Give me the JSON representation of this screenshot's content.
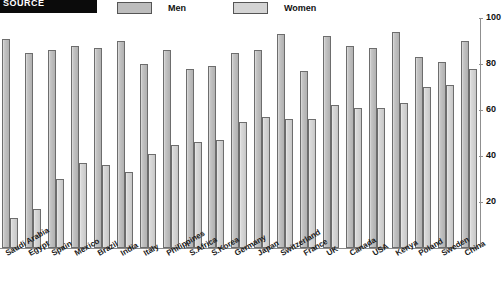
{
  "header": {
    "title_block": "SOURCE",
    "legend": [
      {
        "key": "men",
        "label": "Men",
        "color": "#bcbcbc"
      },
      {
        "key": "women",
        "label": "Women",
        "color": "#d2d2d2"
      }
    ]
  },
  "chart_data": {
    "type": "bar",
    "title": "",
    "xlabel": "",
    "ylabel": "",
    "ylim": [
      0,
      100
    ],
    "yticks": [
      20,
      40,
      60,
      80,
      100
    ],
    "grid": false,
    "axis_position": "right",
    "legend_position": "top",
    "categories": [
      "Saudi Arabia",
      "Egypt",
      "Spain",
      "Mexico",
      "Brazil",
      "India",
      "Italy",
      "Philippines",
      "S.Africa",
      "S.Korea",
      "Germany",
      "Japan",
      "Switzerland",
      "France",
      "UK",
      "Canada",
      "USA",
      "Kenya",
      "Poland",
      "Sweden",
      "China"
    ],
    "series": [
      {
        "name": "Men",
        "color": "#bcbcbc",
        "values": [
          91,
          85,
          86,
          88,
          87,
          90,
          80,
          86,
          78,
          79,
          85,
          86,
          93,
          77,
          92,
          88,
          87,
          94,
          83,
          81,
          90
        ]
      },
      {
        "name": "Women",
        "color": "#d2d2d2",
        "values": [
          13,
          17,
          30,
          37,
          36,
          33,
          41,
          45,
          46,
          47,
          55,
          57,
          56,
          56,
          62,
          61,
          61,
          63,
          70,
          71,
          78
        ]
      }
    ]
  }
}
